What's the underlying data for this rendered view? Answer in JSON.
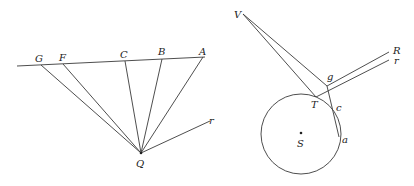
{
  "figure_left": {
    "labels": {
      "G": "G",
      "F": "F",
      "C": "C",
      "B": "B",
      "A": "A",
      "Q": "Q",
      "r": "r"
    }
  },
  "figure_right": {
    "labels": {
      "V": "V",
      "R": "R",
      "r": "r",
      "g": "g",
      "T": "T",
      "c": "c",
      "S": "S",
      "a": "a"
    }
  },
  "colors": {
    "line": "#3a3a3a",
    "text": "#222222",
    "background": "#ffffff"
  }
}
